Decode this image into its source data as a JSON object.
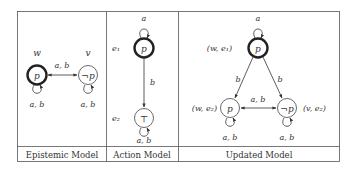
{
  "panels": [
    {
      "caption": "Epistemic Model",
      "nodes": [
        {
          "id": "w",
          "label": "p",
          "name_label": "w",
          "designated": true
        },
        {
          "id": "v",
          "label": "¬p",
          "name_label": "v",
          "designated": false
        }
      ],
      "edges": [
        {
          "from": "w",
          "to": "v",
          "label": "a, b",
          "bidirectional": true
        },
        {
          "from": "w",
          "to": "w",
          "label": "a, b"
        },
        {
          "from": "v",
          "to": "v",
          "label": "a, b"
        }
      ]
    },
    {
      "caption": "Action Model",
      "nodes": [
        {
          "id": "e1",
          "label": "p",
          "name_label": "e₁",
          "designated": true
        },
        {
          "id": "e2",
          "label": "⊤",
          "name_label": "e₂",
          "designated": false
        }
      ],
      "edges": [
        {
          "from": "e1",
          "to": "e1",
          "label": "a"
        },
        {
          "from": "e1",
          "to": "e2",
          "label": "b"
        },
        {
          "from": "e2",
          "to": "e2",
          "label": "a, b"
        }
      ]
    },
    {
      "caption": "Updated Model",
      "nodes": [
        {
          "id": "we1",
          "label": "p",
          "name_label": "(w, e₁)",
          "designated": true
        },
        {
          "id": "we2",
          "label": "p",
          "name_label": "(w, e₂)",
          "designated": false
        },
        {
          "id": "ve2",
          "label": "¬p",
          "name_label": "(v, e₂)",
          "designated": false
        }
      ],
      "edges": [
        {
          "from": "we1",
          "to": "we1",
          "label": "a"
        },
        {
          "from": "we1",
          "to": "we2",
          "label": "b"
        },
        {
          "from": "we1",
          "to": "ve2",
          "label": "b"
        },
        {
          "from": "we2",
          "to": "ve2",
          "label": "a, b",
          "bidirectional": true
        },
        {
          "from": "we2",
          "to": "we2",
          "label": "a, b"
        },
        {
          "from": "ve2",
          "to": "ve2",
          "label": "a, b"
        }
      ]
    }
  ]
}
